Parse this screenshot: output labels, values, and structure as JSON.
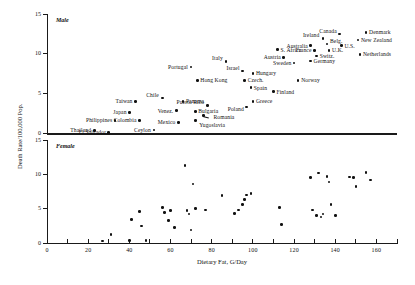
{
  "figure": {
    "xlabel": "Dietary Fat, G/Day",
    "ylabel": "Death Rate/100,000 Pop.",
    "panel_male": "Male",
    "panel_female": "Female"
  },
  "axes": {
    "x_ticklabels": [
      "0",
      "20",
      "40",
      "60",
      "80",
      "100",
      "120",
      "140",
      "160"
    ],
    "y_ticklabels_male": [
      "0",
      "5",
      "10",
      "15"
    ],
    "y_ticklabels_female": [
      "0",
      "5",
      "10",
      "15"
    ]
  },
  "chart_data": {
    "type": "scatter",
    "title": "",
    "xlabel": "Dietary Fat, G/Day",
    "ylabel": "Death Rate/100,000 Pop.",
    "xlim": [
      0,
      170
    ],
    "grid": false,
    "legend": null,
    "panels": [
      {
        "name": "Male",
        "ylim": [
          0,
          15
        ],
        "points": [
          {
            "label": "Thailand",
            "x": 23,
            "y": 0.3,
            "lx": -3,
            "ly": 0,
            "align": "right"
          },
          {
            "label": "El Salvador",
            "x": 30,
            "y": 0.1,
            "lx": -3,
            "ly": 0,
            "align": "right"
          },
          {
            "label": "Philippines",
            "x": 33,
            "y": 1.6,
            "lx": -3,
            "ly": 0,
            "align": "right"
          },
          {
            "label": "Japan",
            "x": 40,
            "y": 2.6,
            "lx": -3,
            "ly": 0,
            "align": "right"
          },
          {
            "label": "Taiwan",
            "x": 43,
            "y": 4.0,
            "lx": -3,
            "ly": 0,
            "align": "right"
          },
          {
            "label": "Colombia",
            "x": 45,
            "y": 1.6,
            "lx": -3,
            "ly": 0,
            "align": "right"
          },
          {
            "label": "Ceylon",
            "x": 52,
            "y": 0.4,
            "lx": -3,
            "ly": 0,
            "align": "right"
          },
          {
            "label": "Chile",
            "x": 56,
            "y": 4.4,
            "lx": -3,
            "ly": -3,
            "align": "right"
          },
          {
            "label": "Venez.",
            "x": 63,
            "y": 2.8,
            "lx": -3,
            "ly": 0,
            "align": "right"
          },
          {
            "label": "Mexico",
            "x": 64,
            "y": 1.3,
            "lx": -3,
            "ly": 0,
            "align": "right"
          },
          {
            "label": "Panama",
            "x": 66,
            "y": 4.0,
            "lx": 3,
            "ly": 0,
            "align": "left"
          },
          {
            "label": "Portugal",
            "x": 70,
            "y": 8.3,
            "lx": -3,
            "ly": 0,
            "align": "right"
          },
          {
            "label": "Hong Kong",
            "x": 73,
            "y": 6.6,
            "lx": 3,
            "ly": 0,
            "align": "left"
          },
          {
            "label": "Bulgaria",
            "x": 72,
            "y": 2.7,
            "lx": 3,
            "ly": 0,
            "align": "left"
          },
          {
            "label": "Puerto Rico",
            "x": 78,
            "y": 3.5,
            "lx": -3,
            "ly": -3,
            "align": "right"
          },
          {
            "label": "Romania",
            "x": 76,
            "y": 2.2,
            "lx": 10,
            "ly": 2,
            "align": "left"
          },
          {
            "label": "Yugoslavia",
            "x": 72,
            "y": 1.6,
            "lx": 4,
            "ly": 5,
            "align": "left"
          },
          {
            "label": "Italy",
            "x": 87,
            "y": 9.0,
            "lx": -3,
            "ly": -3,
            "align": "right"
          },
          {
            "label": "Israel",
            "x": 95,
            "y": 7.8,
            "lx": -3,
            "ly": -3,
            "align": "right"
          },
          {
            "label": "Hungary",
            "x": 100,
            "y": 7.5,
            "lx": 3,
            "ly": 0,
            "align": "left"
          },
          {
            "label": "Czech.",
            "x": 96,
            "y": 6.6,
            "lx": 3,
            "ly": 0,
            "align": "left"
          },
          {
            "label": "Spain",
            "x": 99,
            "y": 5.7,
            "lx": 3,
            "ly": 0,
            "align": "left"
          },
          {
            "label": "Greece",
            "x": 100,
            "y": 4.0,
            "lx": 3,
            "ly": 0,
            "align": "left"
          },
          {
            "label": "Poland",
            "x": 97,
            "y": 3.3,
            "lx": -3,
            "ly": 2,
            "align": "right"
          },
          {
            "label": "Finland",
            "x": 110,
            "y": 5.2,
            "lx": 3,
            "ly": 0,
            "align": "left"
          },
          {
            "label": "Austria",
            "x": 115,
            "y": 9.5,
            "lx": -3,
            "ly": 0,
            "align": "right"
          },
          {
            "label": "Sweden",
            "x": 120,
            "y": 8.8,
            "lx": -3,
            "ly": 0,
            "align": "right"
          },
          {
            "label": "Norway",
            "x": 122,
            "y": 6.6,
            "lx": 3,
            "ly": 0,
            "align": "left"
          },
          {
            "label": "Australia",
            "x": 128,
            "y": 11.0,
            "lx": -3,
            "ly": 0,
            "align": "right"
          },
          {
            "label": "France",
            "x": 130,
            "y": 10.4,
            "lx": -3,
            "ly": 0,
            "align": "right"
          },
          {
            "label": "Germany",
            "x": 128,
            "y": 9.1,
            "lx": 3,
            "ly": 0,
            "align": "left"
          },
          {
            "label": "Switz.",
            "x": 131,
            "y": 9.7,
            "lx": 3,
            "ly": 0,
            "align": "left"
          },
          {
            "label": "Ireland",
            "x": 134,
            "y": 11.9,
            "lx": -3,
            "ly": -3,
            "align": "right"
          },
          {
            "label": "Belg.",
            "x": 136,
            "y": 11.2,
            "lx": 3,
            "ly": -3,
            "align": "left"
          },
          {
            "label": "Canada",
            "x": 142,
            "y": 12.5,
            "lx": -3,
            "ly": -3,
            "align": "right"
          },
          {
            "label": "U.K.",
            "x": 137,
            "y": 10.4,
            "lx": 3,
            "ly": 0,
            "align": "left"
          },
          {
            "label": "U.S.",
            "x": 143,
            "y": 11.0,
            "lx": 3,
            "ly": 0,
            "align": "left"
          },
          {
            "label": "Denmark",
            "x": 155,
            "y": 12.7,
            "lx": 3,
            "ly": 0,
            "align": "left"
          },
          {
            "label": "New Zealand",
            "x": 151,
            "y": 11.7,
            "lx": 3,
            "ly": 0,
            "align": "left"
          },
          {
            "label": "Netherlands",
            "x": 152,
            "y": 9.9,
            "lx": 3,
            "ly": 0,
            "align": "left"
          },
          {
            "label": "S. Africa",
            "x": 112,
            "y": 10.5,
            "lx": 3,
            "ly": 0,
            "align": "left"
          }
        ]
      },
      {
        "name": "Female",
        "ylim": [
          0,
          15
        ],
        "points": [
          {
            "x": 27,
            "y": 0.3
          },
          {
            "x": 31,
            "y": 1.2
          },
          {
            "x": 40,
            "y": 0.4
          },
          {
            "x": 41,
            "y": 3.4
          },
          {
            "x": 45,
            "y": 4.6
          },
          {
            "x": 46,
            "y": 2.5
          },
          {
            "x": 48,
            "y": 0.4
          },
          {
            "x": 56,
            "y": 5.2
          },
          {
            "x": 57,
            "y": 4.4
          },
          {
            "x": 59,
            "y": 3.3
          },
          {
            "x": 60,
            "y": 4.7
          },
          {
            "x": 62,
            "y": 2.3
          },
          {
            "x": 67,
            "y": 11.3
          },
          {
            "x": 68,
            "y": 4.7
          },
          {
            "x": 69,
            "y": 4.2
          },
          {
            "x": 70,
            "y": 1.9
          },
          {
            "x": 71,
            "y": 8.6
          },
          {
            "x": 72,
            "y": 5.0
          },
          {
            "x": 77,
            "y": 4.8
          },
          {
            "x": 85,
            "y": 6.9
          },
          {
            "x": 91,
            "y": 4.3
          },
          {
            "x": 93,
            "y": 4.8
          },
          {
            "x": 95,
            "y": 5.6
          },
          {
            "x": 96,
            "y": 6.3
          },
          {
            "x": 97,
            "y": 7.0
          },
          {
            "x": 99,
            "y": 7.2
          },
          {
            "x": 114,
            "y": 2.7
          },
          {
            "x": 113,
            "y": 5.2
          },
          {
            "x": 128,
            "y": 9.5
          },
          {
            "x": 129,
            "y": 4.8
          },
          {
            "x": 131,
            "y": 4.0
          },
          {
            "x": 132,
            "y": 10.2
          },
          {
            "x": 133,
            "y": 3.8
          },
          {
            "x": 134,
            "y": 4.2
          },
          {
            "x": 136,
            "y": 9.7
          },
          {
            "x": 137,
            "y": 8.9
          },
          {
            "x": 138,
            "y": 5.6
          },
          {
            "x": 140,
            "y": 4.0
          },
          {
            "x": 147,
            "y": 9.6
          },
          {
            "x": 149,
            "y": 9.5
          },
          {
            "x": 150,
            "y": 8.2
          },
          {
            "x": 155,
            "y": 10.3
          },
          {
            "x": 157,
            "y": 9.2
          }
        ]
      }
    ]
  }
}
